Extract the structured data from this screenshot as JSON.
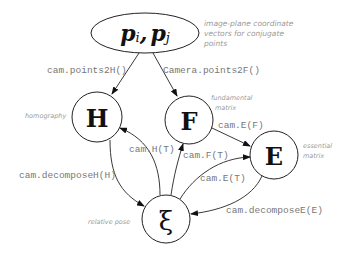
{
  "diagram": {
    "nodes": {
      "points": {
        "label_a": "p",
        "sub_a": "i",
        "sep": ",",
        "label_b": "p",
        "sub_b": "j"
      },
      "H": {
        "label": "H"
      },
      "F": {
        "label": "F"
      },
      "E": {
        "label": "E"
      },
      "xi": {
        "label": "ξ"
      }
    },
    "annotations": {
      "points_line1": "image-plane coordinate",
      "points_line2": "vectors for conjugate",
      "points_line3": "points",
      "homography": "homography",
      "fundamental_line1": "fundamental",
      "fundamental_line2": "matrix",
      "essential_line1": "essential",
      "essential_line2": "matrix",
      "relative_pose": "relative pose"
    },
    "edges": {
      "points_to_H": "cam.points2H()",
      "points_to_F": "Camera.points2F()",
      "F_to_E": "cam.E(F)",
      "xi_to_H": "cam.H(T)",
      "xi_to_F": "cam.F(T)",
      "xi_to_E": "cam.E(T)",
      "H_to_xi": "cam.decomposeH(H)",
      "E_to_xi": "cam.decomposeE(E)"
    },
    "colors": {
      "stroke": "#222222",
      "edge_label": "#777777",
      "annotation": "#9a9a9a",
      "background": "#ffffff"
    }
  }
}
